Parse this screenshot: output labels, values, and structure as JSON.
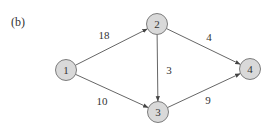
{
  "figure": {
    "panel_label": "(b)",
    "colors": {
      "node_fill": "#d9d9d9",
      "node_stroke": "#6f6f6f",
      "edge": "#555555",
      "text": "#333333"
    },
    "nodes": [
      {
        "id": "1",
        "label": "1",
        "x": 66,
        "y": 70
      },
      {
        "id": "2",
        "label": "2",
        "x": 157,
        "y": 24
      },
      {
        "id": "3",
        "label": "3",
        "x": 158,
        "y": 112
      },
      {
        "id": "4",
        "label": "4",
        "x": 250,
        "y": 69
      }
    ],
    "edges": [
      {
        "from": "1",
        "to": "2",
        "weight": "18",
        "label_x": 104,
        "label_y": 39
      },
      {
        "from": "1",
        "to": "3",
        "weight": "10",
        "label_x": 102,
        "label_y": 105
      },
      {
        "from": "2",
        "to": "4",
        "weight": "4",
        "label_x": 209,
        "label_y": 41
      },
      {
        "from": "2",
        "to": "3",
        "weight": "3",
        "label_x": 169,
        "label_y": 74
      },
      {
        "from": "3",
        "to": "4",
        "weight": "9",
        "label_x": 208,
        "label_y": 104
      }
    ]
  }
}
